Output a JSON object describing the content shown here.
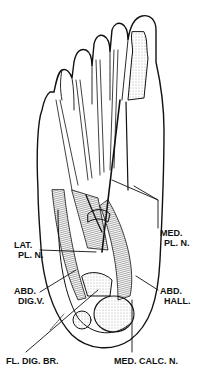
{
  "figure": {
    "labels": [
      {
        "id": "med_pl_n",
        "line1": "MED.",
        "line2": "PL. N."
      },
      {
        "id": "lat_pl_n",
        "line1": "LAT.",
        "line2": "PL. N."
      },
      {
        "id": "abd_dig_v",
        "line1": "ABD.",
        "line2": "DIG.V."
      },
      {
        "id": "abd_hall",
        "line1": "ABD.",
        "line2": "HALL."
      },
      {
        "id": "fl_dig_br",
        "line1": "FL. DIG. BR."
      },
      {
        "id": "med_calc_n",
        "line1": "MED. CALC. N."
      }
    ]
  },
  "colors": {
    "ink": "#111111",
    "paper": "#ffffff",
    "stipple": "#888888"
  }
}
